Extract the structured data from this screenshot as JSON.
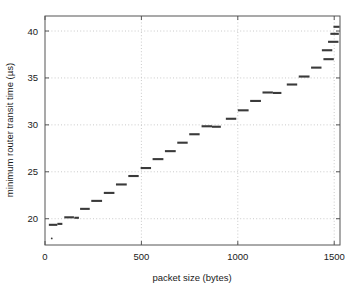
{
  "chart_data": {
    "type": "scatter",
    "title": "",
    "xlabel": "packet size (bytes)",
    "ylabel": "minimum router transit time (µs)",
    "xlim": [
      0,
      1530
    ],
    "ylim": [
      17.2,
      41.6
    ],
    "xticks": [
      0,
      500,
      1000,
      1500
    ],
    "xticklabels": [
      "0",
      "500",
      "1000",
      "1500"
    ],
    "yticks": [
      20,
      25,
      30,
      35,
      40
    ],
    "yticklabels": [
      "20",
      "25",
      "30",
      "35",
      "40"
    ],
    "grid": true,
    "grid_style": "dotted",
    "grid_color": "#bdbdbd",
    "legend": "none",
    "marker_color": "#3a3a3a",
    "axis_color": "#555555",
    "background": "#ffffff",
    "step_width_bytes": 64,
    "series": [
      {
        "name": "minimum router transit time",
        "points": [
          {
            "x_start": 20,
            "x_end": 64,
            "y": 19.35
          },
          {
            "x_start": 64,
            "x_end": 90,
            "y": 19.45
          },
          {
            "x_start": 100,
            "x_end": 150,
            "y": 20.15
          },
          {
            "x_start": 152,
            "x_end": 176,
            "y": 20.1
          },
          {
            "x_start": 182,
            "x_end": 232,
            "y": 21.05
          },
          {
            "x_start": 240,
            "x_end": 296,
            "y": 21.9
          },
          {
            "x_start": 305,
            "x_end": 360,
            "y": 22.75
          },
          {
            "x_start": 368,
            "x_end": 424,
            "y": 23.65
          },
          {
            "x_start": 432,
            "x_end": 486,
            "y": 24.55
          },
          {
            "x_start": 496,
            "x_end": 550,
            "y": 25.4
          },
          {
            "x_start": 558,
            "x_end": 614,
            "y": 26.35
          },
          {
            "x_start": 622,
            "x_end": 678,
            "y": 27.2
          },
          {
            "x_start": 686,
            "x_end": 740,
            "y": 28.1
          },
          {
            "x_start": 748,
            "x_end": 802,
            "y": 29.0
          },
          {
            "x_start": 812,
            "x_end": 866,
            "y": 29.85
          },
          {
            "x_start": 866,
            "x_end": 912,
            "y": 29.8
          },
          {
            "x_start": 938,
            "x_end": 992,
            "y": 30.65
          },
          {
            "x_start": 1000,
            "x_end": 1056,
            "y": 31.55
          },
          {
            "x_start": 1064,
            "x_end": 1120,
            "y": 32.55
          },
          {
            "x_start": 1128,
            "x_end": 1182,
            "y": 33.45
          },
          {
            "x_start": 1182,
            "x_end": 1226,
            "y": 33.4
          },
          {
            "x_start": 1254,
            "x_end": 1308,
            "y": 34.3
          },
          {
            "x_start": 1316,
            "x_end": 1372,
            "y": 35.15
          },
          {
            "x_start": 1380,
            "x_end": 1434,
            "y": 36.1
          },
          {
            "x_start": 1444,
            "x_end": 1498,
            "y": 37.0
          },
          {
            "x_start": 1436,
            "x_end": 1490,
            "y": 37.95
          },
          {
            "x_start": 1468,
            "x_end": 1522,
            "y": 38.85
          },
          {
            "x_start": 1480,
            "x_end": 1524,
            "y": 39.7
          },
          {
            "x_start": 1496,
            "x_end": 1528,
            "y": 40.45
          }
        ]
      }
    ],
    "outliers": [
      {
        "x": 35,
        "y": 17.9
      }
    ]
  }
}
